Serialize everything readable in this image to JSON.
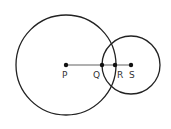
{
  "diagram": {
    "type": "geometry",
    "circles": [
      {
        "name": "large-circle",
        "center": "P",
        "cx": 66,
        "cy": 65,
        "r": 50
      },
      {
        "name": "small-circle",
        "center": "S",
        "cx": 131,
        "cy": 65,
        "r": 29
      }
    ],
    "segment": {
      "from": "P",
      "to": "S",
      "color": "#b0b0b0"
    },
    "points": [
      {
        "label": "P",
        "x": 66,
        "y": 65
      },
      {
        "label": "Q",
        "x": 102,
        "y": 65
      },
      {
        "label": "R",
        "x": 115,
        "y": 65
      },
      {
        "label": "S",
        "x": 131,
        "y": 65
      }
    ]
  }
}
